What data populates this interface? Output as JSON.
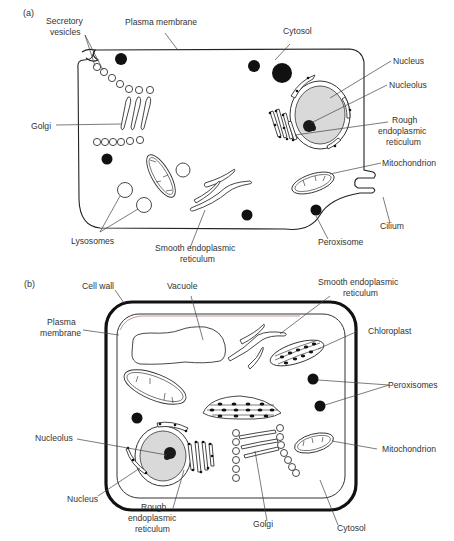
{
  "figure": {
    "panels": [
      {
        "id": "a",
        "panel_label": "(a)",
        "cell_type": "animal cell",
        "labels": {
          "secretory_vesicles": [
            "Secretory",
            "vesicles"
          ],
          "plasma_membrane": "Plasma membrane",
          "cytosol": "Cytosol",
          "nucleus": "Nucleus",
          "nucleolus": "Nucleolus",
          "rough_er": [
            "Rough",
            "endoplasmic",
            "reticulum"
          ],
          "golgi": "Golgi",
          "mitochondrion": "Mitochondrion",
          "lysosomes": "Lysosomes",
          "smooth_er": [
            "Smooth endoplasmic",
            "reticulum"
          ],
          "peroxisome": "Peroxisome",
          "cilium": "Cilium"
        }
      },
      {
        "id": "b",
        "panel_label": "(b)",
        "cell_type": "plant cell",
        "labels": {
          "cell_wall": "Cell wall",
          "vacuole": "Vacuole",
          "smooth_er": [
            "Smooth endoplasmic",
            "reticulum"
          ],
          "plasma_membrane": [
            "Plasma",
            "membrane"
          ],
          "chloroplast": "Chloroplast",
          "peroxisomes": "Peroxisomes",
          "nucleolus": "Nucleolus",
          "mitochondrion": "Mitochondrion",
          "nucleus": "Nucleus",
          "rough_er": [
            "Rough",
            "endoplasmic",
            "reticulum"
          ],
          "golgi": "Golgi",
          "cytosol": "Cytosol"
        }
      }
    ]
  },
  "colors": {
    "line": "#333333",
    "nucleus_fill": "#d9d9d9",
    "dark_organelle": "#111111",
    "background": "#ffffff"
  }
}
